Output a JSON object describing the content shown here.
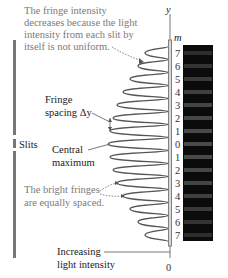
{
  "diagram": {
    "annotations": {
      "fringe_intensity_note": [
        "The fringe intensity",
        "decreases because the light",
        "intensity from each slit by",
        "itself is not uniform."
      ],
      "fringe_spacing": [
        "Fringe",
        "spacing Δy"
      ],
      "central_maximum": [
        "Central",
        "maximum"
      ],
      "equal_spacing_note": [
        "The bright fringes",
        "are equally spaced."
      ],
      "intensity_axis": [
        "Increasing",
        "light intensity"
      ],
      "slits": "Slits"
    },
    "axis": {
      "y_label": "y",
      "m_label": "m",
      "origin_label": "0"
    },
    "m_values": [
      "7",
      "6",
      "5",
      "4",
      "3",
      "2",
      "1",
      "0",
      "1",
      "2",
      "3",
      "4",
      "5",
      "6",
      "7"
    ],
    "fringe_amplitudes_px": [
      23,
      30,
      38,
      45,
      51,
      55,
      58,
      60,
      58,
      55,
      51,
      45,
      38,
      30,
      23
    ],
    "colors": {
      "curve": "#555555",
      "axis": "#6b6b6b",
      "screen": "#0b0b0b",
      "bright_fringe": "#2e2e2e",
      "note_text": "#7a7a7a",
      "label_text": "#1a1a1a"
    }
  }
}
